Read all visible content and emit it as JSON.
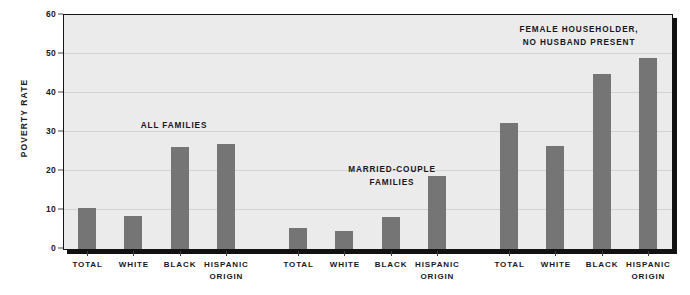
{
  "chart_data": {
    "type": "bar",
    "title": "",
    "ylabel": "Poverty Rate",
    "xlabel": "",
    "ylim": [
      0,
      60
    ],
    "yticks": [
      0,
      10,
      20,
      30,
      40,
      50,
      60
    ],
    "ytick_labels": [
      "0",
      "10",
      "20",
      "30",
      "40",
      "50",
      "60"
    ],
    "grid": true,
    "legend": "none",
    "bar_color": "#757575",
    "plot_background": "#ebebeb",
    "categories": [
      "Total",
      "White",
      "Black",
      "Hispanic\nOrigin"
    ],
    "groups": [
      {
        "name": "All Families",
        "label": "All Families",
        "values": [
          10.6,
          8.6,
          26.4,
          27.0
        ]
      },
      {
        "name": "Married-Couple Families",
        "label": "Married-Couple\nFamilies",
        "values": [
          5.4,
          4.7,
          8.2,
          18.8
        ]
      },
      {
        "name": "Female Householder, No Husband Present",
        "label": "Female Householder,\nNo Husband Present",
        "values": [
          32.4,
          26.5,
          45.0,
          49.3
        ]
      }
    ]
  },
  "axis": {
    "y_title": "Poverty Rate",
    "y_tick_0": "0",
    "y_tick_10": "10",
    "y_tick_20": "20",
    "y_tick_30": "30",
    "y_tick_40": "40",
    "y_tick_50": "50",
    "y_tick_60": "60"
  },
  "xlabels": {
    "g1c1": "Total",
    "g1c2": "White",
    "g1c3": "Black",
    "g1c4": "Hispanic\nOrigin",
    "g2c1": "Total",
    "g2c2": "White",
    "g2c3": "Black",
    "g2c4": "Hispanic\nOrigin",
    "g3c1": "Total",
    "g3c2": "White",
    "g3c3": "Black",
    "g3c4": "Hispanic\nOrigin"
  },
  "annotations": {
    "group1": "All Families",
    "group2": "Married-Couple\nFamilies",
    "group3": "Female Householder,\nNo Husband Present"
  }
}
